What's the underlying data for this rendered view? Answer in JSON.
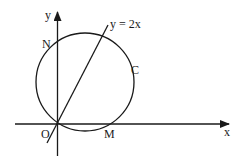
{
  "diagram": {
    "type": "geometry",
    "colors": {
      "stroke": "#1a1a1a",
      "background": "#ffffff"
    },
    "axes": {
      "x_label": "x",
      "y_label": "y",
      "origin_label": "O"
    },
    "points": {
      "origin": "O",
      "x_intercept": "M",
      "y_intercept": "N"
    },
    "circle": {
      "label": "C"
    },
    "line": {
      "equation": "y = 2x"
    }
  }
}
